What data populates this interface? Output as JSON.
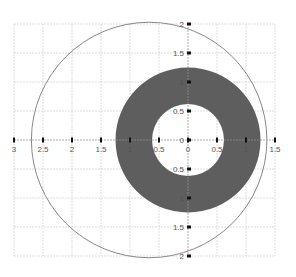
{
  "diagram": {
    "type": "geometry-plot",
    "colors": {
      "background": "#ffffff",
      "grid": "#c8c8c8",
      "axis": "#9a9a9a",
      "tick_mark": "#111111",
      "tick_label": "#555555",
      "circle_stroke": "#7a7a7a",
      "annulus_fill": "#5e5e5e"
    },
    "x_axis": {
      "range": [
        -3,
        1.5
      ],
      "ticks": [
        {
          "value": -3,
          "label": "3"
        },
        {
          "value": -2.5,
          "label": "2.5"
        },
        {
          "value": -2,
          "label": "2"
        },
        {
          "value": -1.5,
          "label": "1.5"
        },
        {
          "value": -1,
          "label": "1"
        },
        {
          "value": -0.5,
          "label": "0.5"
        },
        {
          "value": 0,
          "label": "0"
        },
        {
          "value": 0.5,
          "label": "0.5"
        },
        {
          "value": 1,
          "label": "1"
        },
        {
          "value": 1.5,
          "label": "1.5"
        }
      ]
    },
    "y_axis": {
      "range": [
        -2,
        2
      ],
      "ticks": [
        {
          "value": 2,
          "label": "2"
        },
        {
          "value": 1.5,
          "label": "1.5"
        },
        {
          "value": 1,
          "label": "1"
        },
        {
          "value": 0.5,
          "label": "0.5"
        },
        {
          "value": 0,
          "label": "0"
        },
        {
          "value": -0.5,
          "label": "0.5"
        },
        {
          "value": -1,
          "label": "1"
        },
        {
          "value": -1.5,
          "label": "1.5"
        },
        {
          "value": -2,
          "label": "2"
        }
      ]
    },
    "grid_step": 0.5,
    "shapes": {
      "circle": {
        "center": [
          -0.67,
          0
        ],
        "radius": 2.03,
        "filled": false
      },
      "annulus": {
        "center": [
          0,
          0
        ],
        "outer_radius": 1.25,
        "inner_radius": 0.62,
        "filled": true
      }
    }
  }
}
